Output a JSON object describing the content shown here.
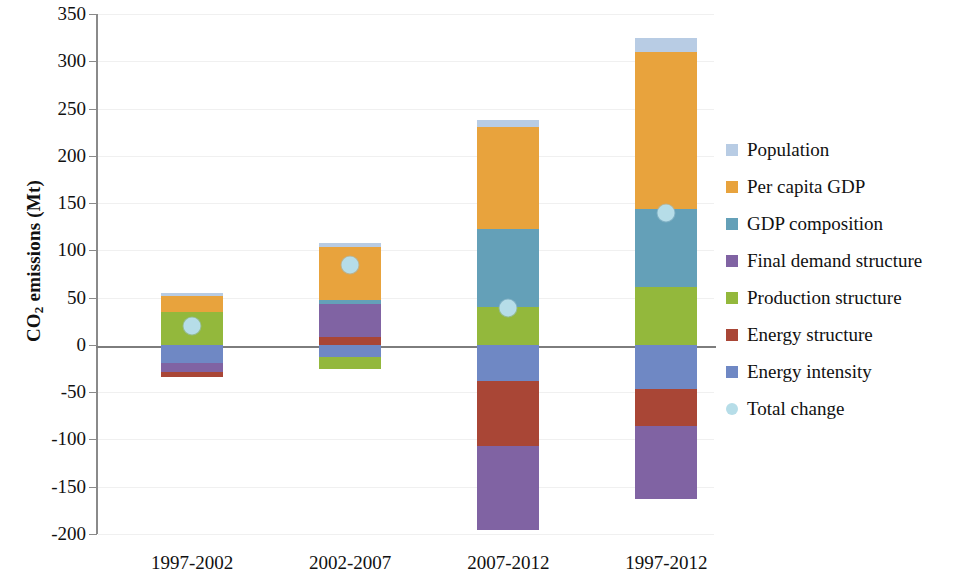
{
  "chart_data": {
    "type": "bar",
    "title": "",
    "subtitle": "",
    "xlabel": "",
    "ylabel": "CO2 emissions (Mt)",
    "ylabel_rich": {
      "pre": "CO",
      "sub": "2",
      "post": " emissions (Mt)"
    },
    "categories": [
      "1997-2002",
      "2002-2007",
      "2007-2012",
      "1997-2012"
    ],
    "ylim": [
      -200,
      350
    ],
    "ytick_step": 50,
    "ytick_labels": [
      "350",
      "300",
      "250",
      "200",
      "150",
      "100",
      "50",
      "0",
      "-50",
      "-100",
      "-150",
      "-200"
    ],
    "ytick_values": [
      350,
      300,
      250,
      200,
      150,
      100,
      50,
      0,
      -50,
      -100,
      -150,
      -200
    ],
    "grid": true,
    "stacked": true,
    "legend_position": "right",
    "series": [
      {
        "name": "Population",
        "color": "#b8cce4",
        "values": [
          3,
          4,
          7,
          15
        ]
      },
      {
        "name": "Per capita GDP",
        "color": "#e8a33d",
        "values": [
          17,
          56,
          108,
          166
        ]
      },
      {
        "name": "GDP composition",
        "color": "#64a0b8",
        "values": [
          0,
          5,
          83,
          83
        ]
      },
      {
        "name": "Final demand structure",
        "color": "#8063a3",
        "values": [
          -10,
          35,
          -89,
          -77
        ]
      },
      {
        "name": "Production structure",
        "color": "#93b83c",
        "values": [
          35,
          -13,
          40,
          61
        ]
      },
      {
        "name": "Energy structure",
        "color": "#a94636",
        "values": [
          -5,
          8,
          -69,
          -39
        ]
      },
      {
        "name": "Energy intensity",
        "color": "#6f88c4",
        "values": [
          -19,
          -13,
          -38,
          -47
        ]
      }
    ],
    "marker_series": {
      "name": "Total change",
      "color": "#b6dde8",
      "values": [
        20,
        84,
        39,
        139
      ]
    },
    "stack_order_positive": [
      [
        "Production structure",
        "Per capita GDP",
        "Population"
      ],
      [
        "Energy structure",
        "Final demand structure",
        "GDP composition",
        "Per capita GDP",
        "Population"
      ],
      [
        "Production structure",
        "GDP composition",
        "Per capita GDP",
        "Population"
      ],
      [
        "Production structure",
        "GDP composition",
        "Per capita GDP",
        "Population"
      ]
    ],
    "stack_order_negative": [
      [
        "Energy intensity",
        "Final demand structure",
        "Energy structure"
      ],
      [
        "Energy intensity",
        "Production structure"
      ],
      [
        "Energy intensity",
        "Energy structure",
        "Final demand structure"
      ],
      [
        "Energy intensity",
        "Energy structure",
        "Final demand structure"
      ]
    ]
  },
  "legend": {
    "items": [
      {
        "label": "Population",
        "color": "#b8cce4",
        "shape": "square"
      },
      {
        "label": "Per capita GDP",
        "color": "#e8a33d",
        "shape": "square"
      },
      {
        "label": "GDP composition",
        "color": "#64a0b8",
        "shape": "square"
      },
      {
        "label": "Final demand structure",
        "color": "#8063a3",
        "shape": "square"
      },
      {
        "label": "Production structure",
        "color": "#93b83c",
        "shape": "square"
      },
      {
        "label": "Energy structure",
        "color": "#a94636",
        "shape": "square"
      },
      {
        "label": "Energy intensity",
        "color": "#6f88c4",
        "shape": "square"
      },
      {
        "label": "Total change",
        "color": "#b6dde8",
        "shape": "circle"
      }
    ]
  }
}
